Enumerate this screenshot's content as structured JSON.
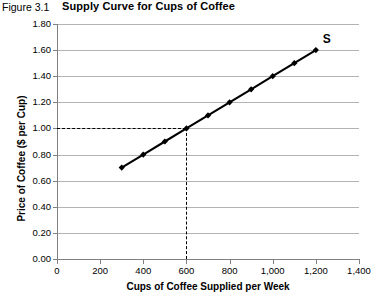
{
  "figure": {
    "label": "Figure 3.1",
    "title": "Supply Curve for Cups of Coffee"
  },
  "chart_data": {
    "type": "line",
    "title": "Supply Curve for Cups of Coffee",
    "xlabel": "Cups of Coffee Supplied per Week",
    "ylabel": "Price of Coffee ($ per Cup)",
    "xlim": [
      0,
      1400
    ],
    "ylim": [
      0.0,
      1.8
    ],
    "grid": "horizontal",
    "legend": "none",
    "x": [
      300,
      400,
      500,
      600,
      700,
      800,
      900,
      1000,
      1100,
      1200
    ],
    "values": [
      0.7,
      0.8,
      0.9,
      1.0,
      1.1,
      1.2,
      1.3,
      1.4,
      1.5,
      1.6
    ],
    "series": [
      {
        "name": "S",
        "x": [
          300,
          400,
          500,
          600,
          700,
          800,
          900,
          1000,
          1100,
          1200
        ],
        "values": [
          0.7,
          0.8,
          0.9,
          1.0,
          1.1,
          1.2,
          1.3,
          1.4,
          1.5,
          1.6
        ]
      }
    ],
    "series_label": "S",
    "xticks": [
      0,
      200,
      400,
      600,
      800,
      1000,
      1200,
      1400
    ],
    "xtick_labels": [
      "0",
      "200",
      "400",
      "600",
      "800",
      "1,000",
      "1,200",
      "1,400"
    ],
    "yticks": [
      0.0,
      0.2,
      0.4,
      0.6,
      0.8,
      1.0,
      1.2,
      1.4,
      1.6,
      1.8
    ],
    "ytick_labels": [
      "0.00",
      "0.20",
      "0.40",
      "0.60",
      "0.80",
      "1.00",
      "1.20",
      "1.40",
      "1.60",
      "1.80"
    ],
    "annotations": [
      {
        "name": "equilibrium-guide",
        "x": 600,
        "y": 1.0,
        "style": "dashed"
      }
    ],
    "colors": {
      "series": "#000000",
      "gridline": "#b3b3b3",
      "axis": "#808080",
      "background": "#ffffff"
    }
  }
}
